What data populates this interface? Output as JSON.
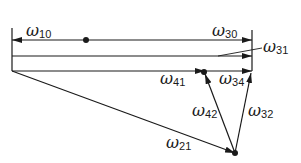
{
  "diagram": {
    "labels": {
      "w10": {
        "sym": "ω",
        "sub": "10"
      },
      "w30": {
        "sym": "ω",
        "sub": "30"
      },
      "w31": {
        "sym": "ω",
        "sub": "31"
      },
      "w41": {
        "sym": "ω",
        "sub": "41"
      },
      "w34": {
        "sym": "ω",
        "sub": "34"
      },
      "w42": {
        "sym": "ω",
        "sub": "42"
      },
      "w32": {
        "sym": "ω",
        "sub": "32"
      },
      "w21": {
        "sym": "ω",
        "sub": "21"
      }
    },
    "colors": {
      "stroke": "#1a1a1a",
      "background": "#ffffff"
    }
  }
}
